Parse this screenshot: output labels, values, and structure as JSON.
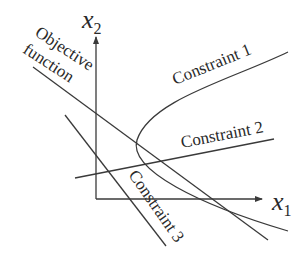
{
  "diagram": {
    "type": "linear-programming-feasible-region",
    "axes": {
      "x": {
        "label": "x",
        "subscript": "1"
      },
      "y": {
        "label": "x",
        "subscript": "2"
      }
    },
    "labels": {
      "objective_line1": "Objective",
      "objective_line2": "function",
      "constraint1": "Constraint 1",
      "constraint2": "Constraint 2",
      "constraint3": "Constraint 3"
    },
    "colors": {
      "stroke": "#3a3a3a",
      "text": "#2a2a2a",
      "background": "#ffffff"
    }
  }
}
